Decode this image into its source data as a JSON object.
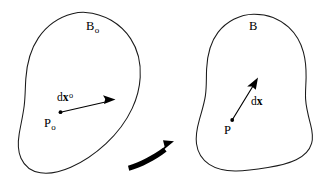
{
  "figure": {
    "background_color": "#ffffff",
    "line_color": "#1a1a1a",
    "text_color": "#000000",
    "width": 325,
    "height": 183
  },
  "reference_configuration": {
    "region_label": {
      "base": "B",
      "subscript": "o",
      "full": "Bo"
    },
    "point_label": {
      "base": "P",
      "subscript": "o",
      "full": "Po"
    },
    "vector_label": {
      "prefix": "d",
      "symbol": "x",
      "superscript": "o",
      "full": "dxo"
    }
  },
  "current_configuration": {
    "region_label": {
      "base": "B",
      "subscript": "",
      "full": "B"
    },
    "point_label": {
      "base": "P",
      "subscript": "",
      "full": "P"
    },
    "vector_label": {
      "prefix": "d",
      "symbol": "x",
      "superscript": "",
      "full": "dx"
    }
  },
  "mapping_arrow": {
    "name": "deformation-map-arrow",
    "direction": "left-to-right, curving upward",
    "color": "#000000"
  }
}
